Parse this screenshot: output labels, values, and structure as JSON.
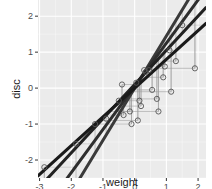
{
  "chart_data": {
    "type": "scatter",
    "title": "",
    "xlabel": "weight",
    "ylabel": "disc",
    "xlim": [
      -3.05,
      2.25
    ],
    "ylim": [
      -2.5,
      2.45
    ],
    "x_ticks": [
      -3,
      -2,
      -1,
      0,
      1,
      2
    ],
    "y_ticks": [
      -2,
      -1,
      0,
      1,
      2
    ],
    "x_tick_labels": [
      "-3",
      "-2",
      "-1",
      "0",
      "1",
      "2"
    ],
    "y_tick_labels": [
      "-2",
      "-1",
      "0",
      "1",
      "2"
    ],
    "grid": true,
    "legend": null,
    "points": [
      {
        "x": -2.85,
        "y": -2.2
      },
      {
        "x": -1.85,
        "y": -1.55
      },
      {
        "x": -1.25,
        "y": -1.0
      },
      {
        "x": -0.9,
        "y": -0.85
      },
      {
        "x": -0.5,
        "y": -0.35
      },
      {
        "x": -0.4,
        "y": 0.1
      },
      {
        "x": -0.35,
        "y": -0.75
      },
      {
        "x": -0.15,
        "y": -0.65
      },
      {
        "x": -0.1,
        "y": -1.0
      },
      {
        "x": 0.05,
        "y": 0.15
      },
      {
        "x": 0.1,
        "y": -0.9
      },
      {
        "x": 0.15,
        "y": -0.35
      },
      {
        "x": 0.2,
        "y": -0.5
      },
      {
        "x": 0.3,
        "y": 0.5
      },
      {
        "x": 0.35,
        "y": 0.45
      },
      {
        "x": 0.45,
        "y": 0.5
      },
      {
        "x": 0.55,
        "y": -0.05
      },
      {
        "x": 0.7,
        "y": -0.3
      },
      {
        "x": 0.75,
        "y": -0.65
      },
      {
        "x": 0.9,
        "y": 0.3
      },
      {
        "x": 0.95,
        "y": 0.6
      },
      {
        "x": 1.1,
        "y": 1.05
      },
      {
        "x": 1.15,
        "y": -0.1
      },
      {
        "x": 1.3,
        "y": 0.75
      },
      {
        "x": 1.5,
        "y": 1.75
      },
      {
        "x": 1.9,
        "y": 0.55
      }
    ],
    "fit_lines": [
      {
        "name": "fit-1",
        "intercept": 0.0,
        "slope": 1.45,
        "color": "#3a3a3a",
        "width": 3
      },
      {
        "name": "fit-2",
        "intercept": 0.05,
        "slope": 1.2,
        "color": "#2e2e2e",
        "width": 3
      },
      {
        "name": "fit-3",
        "intercept": 0.1,
        "slope": 0.95,
        "color": "#222222",
        "width": 3
      },
      {
        "name": "fit-4",
        "intercept": 0.0,
        "slope": 0.8,
        "color": "#1a1a1a",
        "width": 3
      }
    ],
    "segments_note": "thin grey connectors link each point to its fitted values"
  },
  "colors": {
    "panel_bg": "#ebebeb",
    "grid_major": "#ffffff",
    "point_stroke": "#555555",
    "segment": "#9a9a9a"
  }
}
